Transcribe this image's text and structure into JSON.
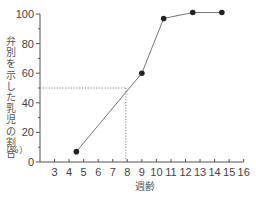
{
  "chart_data": {
    "type": "line",
    "title": "",
    "xlabel": "週齢",
    "ylabel": "弁別を示した乳児の割合",
    "ylabel_unit": "（%）",
    "x": [
      4.5,
      9,
      10.5,
      12.5,
      14.5
    ],
    "series": [
      {
        "name": "弁別を示した乳児の割合",
        "values": [
          7,
          60,
          97,
          101,
          101
        ]
      }
    ],
    "xticks": [
      3,
      4,
      5,
      6,
      7,
      8,
      9,
      10,
      11,
      12,
      13,
      14,
      15,
      16
    ],
    "yticks": [
      0,
      20,
      40,
      60,
      80,
      100
    ],
    "yticks_minor": [
      10,
      30,
      50,
      70,
      90
    ],
    "xlim": [
      2,
      16
    ],
    "ylim": [
      0,
      100
    ],
    "grid": false,
    "legend": null,
    "annotations": [
      {
        "type": "dotted-reference",
        "y": 50,
        "x": 7.9,
        "description": "50% line meeting curve at ~7.9 weeks"
      }
    ],
    "colors": {
      "line": "#666666",
      "marker": "#222222",
      "axis": "#555555",
      "reference": "#777777"
    }
  }
}
